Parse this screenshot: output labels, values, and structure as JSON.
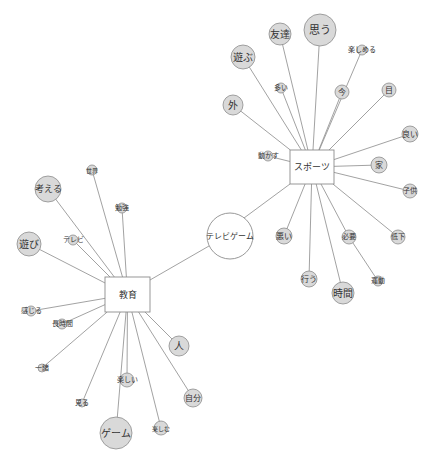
{
  "diagram": {
    "type": "co-occurrence-network",
    "colors": {
      "edge": "#8a8a8a",
      "node_fill": "#d9d9d9",
      "node_stroke": "#8c8c8c",
      "hub_fill": "#ffffff",
      "text": "#333333"
    },
    "hubs": [
      {
        "id": "sports",
        "label": "スポーツ",
        "shape": "box",
        "x": 290,
        "y": 150,
        "w": 44,
        "h": 34
      },
      {
        "id": "education",
        "label": "教育",
        "shape": "box",
        "x": 105,
        "y": 277,
        "w": 45,
        "h": 35
      },
      {
        "id": "tvgame",
        "label": "テレビゲーム",
        "shape": "circle",
        "cx": 230,
        "cy": 236,
        "r": 23
      }
    ],
    "nodes": [
      {
        "id": "omou",
        "label": "思う",
        "cx": 320,
        "cy": 30,
        "r": 16,
        "font": 11,
        "hub": "sports"
      },
      {
        "id": "tomodachi",
        "label": "友達",
        "cx": 280,
        "cy": 34,
        "r": 11,
        "font": 10,
        "hub": "sports"
      },
      {
        "id": "asobu",
        "label": "遊ぶ",
        "cx": 243,
        "cy": 57,
        "r": 12,
        "font": 10,
        "hub": "sports"
      },
      {
        "id": "tanoshimeru",
        "label": "楽しめる",
        "cx": 362,
        "cy": 50,
        "r": 5,
        "font": 7,
        "hub": "sports"
      },
      {
        "id": "ooi",
        "label": "多い",
        "cx": 281,
        "cy": 88,
        "r": 5,
        "font": 7,
        "hub": "sports"
      },
      {
        "id": "ima",
        "label": "今",
        "cx": 342,
        "cy": 92,
        "r": 7,
        "font": 8,
        "hub": "sports"
      },
      {
        "id": "me",
        "label": "目",
        "cx": 389,
        "cy": 90,
        "r": 7,
        "font": 8,
        "hub": "sports"
      },
      {
        "id": "soto",
        "label": "外",
        "cx": 233,
        "cy": 105,
        "r": 10,
        "font": 10,
        "hub": "sports"
      },
      {
        "id": "yoi",
        "label": "良い",
        "cx": 410,
        "cy": 134,
        "r": 8,
        "font": 8,
        "hub": "sports"
      },
      {
        "id": "ugokasu",
        "label": "動かす",
        "cx": 268,
        "cy": 156,
        "r": 5,
        "font": 7,
        "hub": "sports"
      },
      {
        "id": "ie",
        "label": "家",
        "cx": 379,
        "cy": 165,
        "r": 8,
        "font": 8,
        "hub": "sports"
      },
      {
        "id": "kodomo",
        "label": "子供",
        "cx": 410,
        "cy": 191,
        "r": 7,
        "font": 7,
        "hub": "sports"
      },
      {
        "id": "teika",
        "label": "低下",
        "cx": 398,
        "cy": 237,
        "r": 7,
        "font": 7,
        "hub": "sports"
      },
      {
        "id": "warui",
        "label": "悪い",
        "cx": 284,
        "cy": 236,
        "r": 8,
        "font": 8,
        "hub": "sports"
      },
      {
        "id": "hitsuyou",
        "label": "必要",
        "cx": 349,
        "cy": 237,
        "r": 7,
        "font": 7,
        "hub": "sports"
      },
      {
        "id": "okonau",
        "label": "行う",
        "cx": 309,
        "cy": 279,
        "r": 8,
        "font": 8,
        "hub": "sports"
      },
      {
        "id": "undou",
        "label": "運動",
        "cx": 378,
        "cy": 281,
        "r": 5,
        "font": 7,
        "hub": "sports",
        "via": "hitsuyou"
      },
      {
        "id": "jikan",
        "label": "時間",
        "cx": 343,
        "cy": 293,
        "r": 11,
        "font": 10,
        "hub": "sports"
      },
      {
        "id": "sekai",
        "label": "世界",
        "cx": 92,
        "cy": 170,
        "r": 5,
        "font": 6,
        "hub": "education"
      },
      {
        "id": "kangaeru",
        "label": "考える",
        "cx": 48,
        "cy": 189,
        "r": 13,
        "font": 9,
        "hub": "education"
      },
      {
        "id": "benkyou",
        "label": "勉強",
        "cx": 122,
        "cy": 208,
        "r": 5,
        "font": 7,
        "hub": "education"
      },
      {
        "id": "terebi",
        "label": "テレビ",
        "cx": 73,
        "cy": 240,
        "r": 5,
        "font": 7,
        "hub": "education"
      },
      {
        "id": "asobi",
        "label": "遊び",
        "cx": 29,
        "cy": 244,
        "r": 12,
        "font": 10,
        "hub": "education"
      },
      {
        "id": "kanjiru",
        "label": "感じる",
        "cx": 31,
        "cy": 311,
        "r": 5,
        "font": 7,
        "hub": "education"
      },
      {
        "id": "choujikan",
        "label": "長時間",
        "cx": 62,
        "cy": 324,
        "r": 5,
        "font": 7,
        "hub": "education"
      },
      {
        "id": "hito",
        "label": "人",
        "cx": 179,
        "cy": 346,
        "r": 10,
        "font": 10,
        "hub": "education"
      },
      {
        "id": "issho",
        "label": "一緒",
        "cx": 42,
        "cy": 368,
        "r": 4,
        "font": 7,
        "hub": "education"
      },
      {
        "id": "tanoshii",
        "label": "楽しい",
        "cx": 127,
        "cy": 380,
        "r": 7,
        "font": 7,
        "hub": "education"
      },
      {
        "id": "jibun",
        "label": "自分",
        "cx": 193,
        "cy": 398,
        "r": 9,
        "font": 8,
        "hub": "education"
      },
      {
        "id": "miru",
        "label": "見る",
        "cx": 82,
        "cy": 403,
        "r": 4,
        "font": 7,
        "hub": "education"
      },
      {
        "id": "geemu",
        "label": "ゲーム",
        "cx": 116,
        "cy": 433,
        "r": 16,
        "font": 10,
        "hub": "education"
      },
      {
        "id": "tanoshimu",
        "label": "楽しむ",
        "cx": 161,
        "cy": 428,
        "r": 7,
        "font": 6,
        "hub": "education"
      }
    ],
    "hub_links": [
      {
        "from": "tvgame",
        "to": "sports",
        "x1": 244,
        "y1": 218,
        "x2": 290,
        "y2": 184
      },
      {
        "from": "tvgame",
        "to": "education",
        "x1": 209,
        "y1": 246,
        "x2": 150,
        "y2": 280
      }
    ]
  }
}
